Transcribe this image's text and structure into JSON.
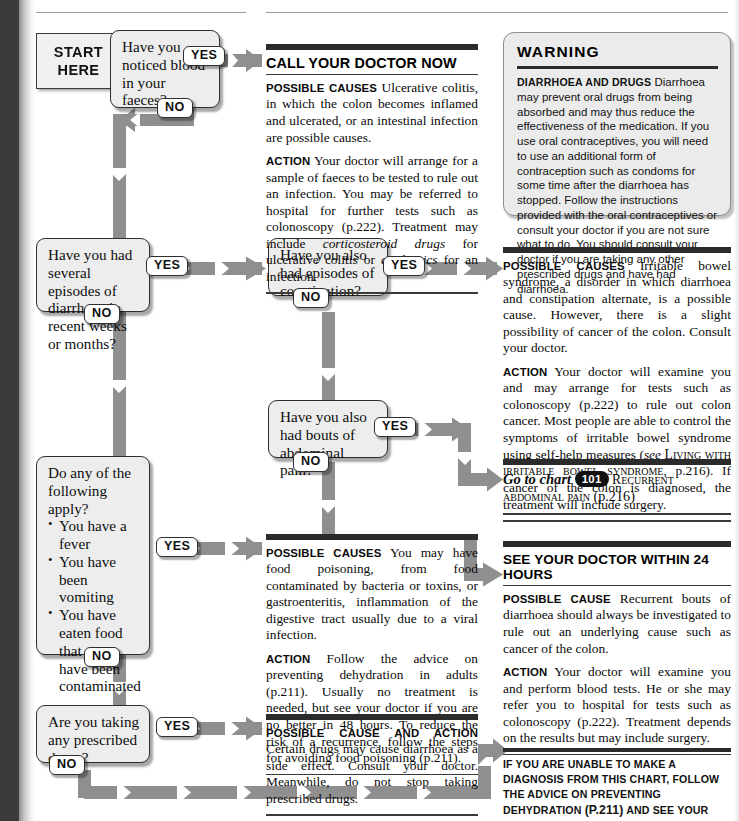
{
  "chart": {
    "start_label_line1": "START",
    "start_label_line2": "HERE",
    "yes": "YES",
    "no": "NO"
  },
  "questions": [
    {
      "id": "q1",
      "text": "Have you noticed blood in your faeces?"
    },
    {
      "id": "q2",
      "text": "Have you had several episodes of diarrhoea in recent weeks or months?"
    },
    {
      "id": "q3",
      "text": "Have you also had episodes of constipation?"
    },
    {
      "id": "q4",
      "text": "Have you also had bouts of abdominal pain?"
    },
    {
      "id": "q5",
      "text": "Do any of the following apply?",
      "bullets": [
        "You have a fever",
        "You have been vomiting",
        "You have eaten food that may have been contaminated"
      ]
    },
    {
      "id": "q6",
      "text": "Are you taking any prescribed drugs?"
    }
  ],
  "content": {
    "call_doctor": {
      "title": "CALL YOUR DOCTOR NOW",
      "causes_label": "Possible causes",
      "causes_text": "Ulcerative colitis, in which the colon becomes inflamed and ulcerated, or an intestinal infection are possible causes.",
      "action_label": "Action",
      "action_text_1": "Your doctor will arrange for a sample of faeces to be tested to rule out an infection. You may be referred to hospital for further tests such as colonoscopy (p.222). Treatment may include ",
      "action_italic_1": "corticosteroid drugs",
      "action_text_2": " for ulcerative colitis or ",
      "action_italic_2": "antibiotics",
      "action_text_3": " for an infection."
    },
    "food_poisoning": {
      "causes_label": "Possible causes",
      "causes_text": "You may have food poisoning, from food contaminated by bacteria or toxins, or gastroenteritis, inflammation of the digestive tract usually due to a viral infection.",
      "action_label": "Action",
      "action_text": "Follow the advice on preventing dehydration in adults (p.211). Usually no treatment is needed, but see your doctor if you are no better in 48 hours. To reduce the risk of a recurrence, follow the steps for avoiding food poisoning (p.211)."
    },
    "prescribed_drugs": {
      "label": "Possible cause and action",
      "text": "Certain drugs may cause diarrhoea as a side effect. Consult your doctor. Meanwhile, do not stop taking prescribed drugs."
    }
  },
  "right": {
    "warning": {
      "title": "WARNING",
      "label": "Diarrhoea and drugs",
      "text": "Diarrhoea may prevent oral drugs from being absorbed and may thus reduce the effectiveness of the medication. If you use oral contraceptives, you will need to use an additional form of contraception such as condoms for some time after the diarrhoea has stopped. Follow the instructions provided with the oral contraceptives or consult your doctor if you are not sure what to do. You should consult your doctor if you are taking any other prescribed drugs and have had diarrhoea."
    },
    "ibs": {
      "causes_label": "Possible causes",
      "causes_text": "Irritable bowel syndrome, a disorder in which diarrhoea and constipation alternate, is a possible cause. However, there is a slight possibility of cancer of the colon. Consult your doctor.",
      "action_label": "Action",
      "action_text_1": "Your doctor will examine you and may arrange for tests such as colonoscopy (p.222) to rule out colon cancer. Most people are able to control the symptoms of irritable bowel syndrome using self-help measures (",
      "action_see": "see",
      "action_smallcaps": "Living with irritable bowel syndrome",
      "action_text_2": ", p.216). If cancer of the colon is diagnosed, the treatment will include surgery."
    },
    "goto_chart": {
      "prefix": "Go to chart",
      "number": "101",
      "name": "Recurrent abdominal pain",
      "page": "(p.216)"
    },
    "see_doctor_24h": {
      "title": "SEE YOUR DOCTOR WITHIN 24 HOURS",
      "cause_label": "Possible cause",
      "cause_text": "Recurrent bouts of diarrhoea should always be investigated to rule out an underlying cause such as cancer of the colon.",
      "action_label": "Action",
      "action_text": "Your doctor will examine you and perform blood tests. He or she may refer you to hospital for tests such as colonoscopy (p.222). Treatment depends on the results but may include surgery."
    },
    "footnote": {
      "part1": "If you are unable to make a diagnosis from this chart, follow the advice on preventing dehydration ",
      "page": "(p.211)",
      "part2": " and see your doctor if you are no better in ",
      "hours": "48",
      "part3": " hours."
    }
  },
  "colors": {
    "arrow": "#8f8f8f",
    "box_fill": "#ededed",
    "box_border": "#2f2f2f",
    "rule": "#2b2b2b",
    "gutter": "#3a3a3a"
  }
}
